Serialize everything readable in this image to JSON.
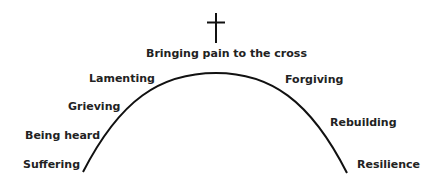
{
  "diagram": {
    "title": "Bringing pain to the cross",
    "symbol": "cross-icon",
    "left_stages": [
      "Suffering",
      "Being heard",
      "Grieving",
      "Lamenting"
    ],
    "right_stages": [
      "Forgiving",
      "Rebuilding",
      "Resilience"
    ],
    "colors": {
      "line": "#111111",
      "text": "#222222",
      "background": "#ffffff"
    }
  }
}
